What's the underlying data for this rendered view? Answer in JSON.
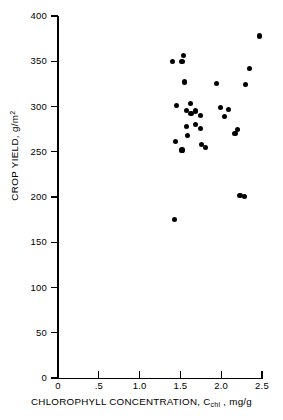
{
  "chart_data": {
    "type": "scatter",
    "title": "",
    "xlabel": "CHLOROPHYLL CONCENTRATION, C_chl , mg/g",
    "ylabel": "CROP YIELD, g/m^2",
    "xlabel_parts": {
      "pre": "CHLOROPHYLL CONCENTRATION, C",
      "sub": "chl",
      "post": " , mg/g"
    },
    "ylabel_parts": {
      "pre": "CROP YIELD, g/m",
      "sup": "2"
    },
    "xlim": [
      0,
      2.5
    ],
    "ylim": [
      0,
      400
    ],
    "grid": false,
    "legend": null,
    "marker": "filled-circle",
    "marker_color": "#000000",
    "xticks": [
      0,
      0.5,
      1.0,
      1.5,
      2.0,
      2.5
    ],
    "xticklabels": [
      "0",
      ".5",
      "1.0",
      "1.5",
      "2.0",
      "2.5"
    ],
    "yticks": [
      0,
      50,
      100,
      150,
      200,
      250,
      300,
      350,
      400
    ],
    "yticklabels": [
      "0",
      "50",
      "100",
      "150",
      "200",
      "250",
      "300",
      "350",
      "400"
    ],
    "x": [
      1.43,
      1.45,
      1.4,
      1.54,
      1.55,
      1.57,
      1.62,
      1.44,
      1.52,
      1.57,
      1.63,
      1.69,
      1.75,
      1.59,
      1.69,
      1.76,
      1.81,
      1.52,
      1.75,
      1.94,
      1.99,
      2.04,
      2.09,
      2.17,
      2.2,
      2.23,
      2.29,
      2.3,
      2.35,
      2.47
    ],
    "y": [
      175,
      301,
      350,
      356,
      327,
      296,
      303,
      261,
      252,
      278,
      292,
      295,
      290,
      268,
      280,
      258,
      255,
      350,
      276,
      325,
      299,
      289,
      297,
      270,
      275,
      202,
      201,
      324,
      342,
      378
    ],
    "points": [
      {
        "x": 1.43,
        "y": 175
      },
      {
        "x": 1.45,
        "y": 301
      },
      {
        "x": 1.4,
        "y": 350
      },
      {
        "x": 1.54,
        "y": 356
      },
      {
        "x": 1.55,
        "y": 327
      },
      {
        "x": 1.57,
        "y": 296
      },
      {
        "x": 1.62,
        "y": 303
      },
      {
        "x": 1.44,
        "y": 261
      },
      {
        "x": 1.52,
        "y": 252
      },
      {
        "x": 1.57,
        "y": 278
      },
      {
        "x": 1.63,
        "y": 292
      },
      {
        "x": 1.69,
        "y": 295
      },
      {
        "x": 1.75,
        "y": 290
      },
      {
        "x": 1.59,
        "y": 268
      },
      {
        "x": 1.69,
        "y": 280
      },
      {
        "x": 1.76,
        "y": 258
      },
      {
        "x": 1.81,
        "y": 255
      },
      {
        "x": 1.52,
        "y": 350
      },
      {
        "x": 1.75,
        "y": 276
      },
      {
        "x": 1.94,
        "y": 325
      },
      {
        "x": 1.99,
        "y": 299
      },
      {
        "x": 2.04,
        "y": 289
      },
      {
        "x": 2.09,
        "y": 297
      },
      {
        "x": 2.17,
        "y": 270
      },
      {
        "x": 2.2,
        "y": 275
      },
      {
        "x": 2.23,
        "y": 202
      },
      {
        "x": 2.29,
        "y": 201
      },
      {
        "x": 2.3,
        "y": 324
      },
      {
        "x": 2.35,
        "y": 342
      },
      {
        "x": 2.47,
        "y": 378
      }
    ],
    "n_points": 30
  }
}
